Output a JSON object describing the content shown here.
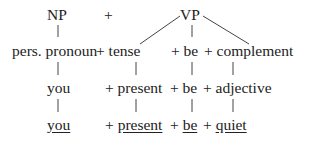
{
  "diagram": {
    "type": "syntactic derivation tree",
    "row1": {
      "np": "NP",
      "plus": "+",
      "vp": "VP"
    },
    "row2": {
      "a": "pers. pronoun",
      "b": "+ tense",
      "c": "+ be",
      "d": "+ complement"
    },
    "row3": {
      "a": "you",
      "b": "+ present",
      "c": "+ be",
      "d": "+ adjective"
    },
    "row4": {
      "a": "you",
      "b_plus": "+ ",
      "b": "present",
      "c_plus": "+ ",
      "c": "be",
      "d_plus": "+ ",
      "d": "quiet"
    },
    "underlined": [
      "you",
      "present",
      "be",
      "quiet"
    ],
    "line_color": "#333333"
  }
}
